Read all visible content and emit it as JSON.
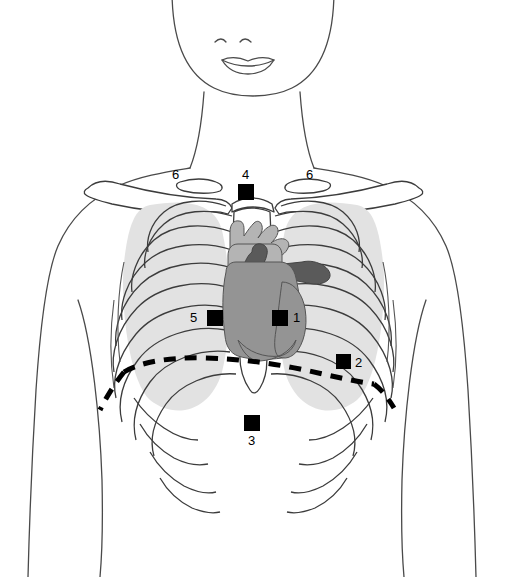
{
  "diagram": {
    "view": "anterior",
    "background_color": "#ffffff",
    "outline_color": "#3c3c3c",
    "colors": {
      "marker_fill": "#000000",
      "label_text": "#000000",
      "lung_field": "#e2e2e2",
      "rib_outline": "#3c3c3c",
      "heart_light": "#b4b4b4",
      "heart_medium": "#949494",
      "heart_dark": "#5a5a5a",
      "body_outline": "#4a4a4a",
      "dashed_line": "#000000"
    },
    "markers": [
      {
        "id": "marker-1",
        "label": "1",
        "x": 272,
        "y": 310,
        "size": 16,
        "label_side": "right",
        "label_x": 293,
        "label_y": 311
      },
      {
        "id": "marker-2",
        "label": "2",
        "x": 336,
        "y": 354,
        "size": 15,
        "label_side": "right",
        "label_x": 355,
        "label_y": 356
      },
      {
        "id": "marker-3",
        "label": "3",
        "x": 244,
        "y": 415,
        "size": 16,
        "label_side": "below",
        "label_x": 248,
        "label_y": 434
      },
      {
        "id": "marker-4",
        "label": "4",
        "x": 238,
        "y": 184,
        "size": 16,
        "label_side": "above",
        "label_x": 242,
        "label_y": 168
      },
      {
        "id": "marker-5",
        "label": "5",
        "x": 207,
        "y": 310,
        "size": 16,
        "label_side": "left",
        "label_x": 190,
        "label_y": 311
      },
      {
        "id": "marker-6-left",
        "label": "6",
        "x": null,
        "y": null,
        "size": 0,
        "label_side": "standalone",
        "label_x": 172,
        "label_y": 168
      },
      {
        "id": "marker-6-right",
        "label": "6",
        "x": null,
        "y": null,
        "size": 0,
        "label_side": "standalone",
        "label_x": 306,
        "label_y": 168
      }
    ],
    "structures": [
      {
        "name": "head-chin",
        "kind": "outline"
      },
      {
        "name": "mouth",
        "kind": "outline"
      },
      {
        "name": "nostrils",
        "kind": "outline"
      },
      {
        "name": "neck",
        "kind": "outline"
      },
      {
        "name": "shoulders-torso",
        "kind": "outline"
      },
      {
        "name": "clavicle-left",
        "kind": "bone"
      },
      {
        "name": "clavicle-right",
        "kind": "bone"
      },
      {
        "name": "scapula-left",
        "kind": "bone"
      },
      {
        "name": "scapula-right",
        "kind": "bone"
      },
      {
        "name": "lung-field-left",
        "kind": "shaded"
      },
      {
        "name": "lung-field-right",
        "kind": "shaded"
      },
      {
        "name": "ribcage",
        "kind": "bone"
      },
      {
        "name": "sternum",
        "kind": "bone"
      },
      {
        "name": "xiphoid-process",
        "kind": "bone"
      },
      {
        "name": "heart-ventricles",
        "kind": "organ"
      },
      {
        "name": "aorta-great-vessels",
        "kind": "organ"
      },
      {
        "name": "pulmonary-artery",
        "kind": "organ"
      },
      {
        "name": "diaphragm-dashed-line",
        "kind": "dashed"
      }
    ]
  }
}
